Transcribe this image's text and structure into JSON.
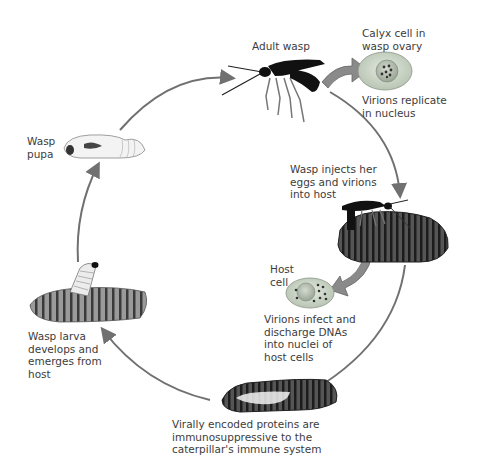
{
  "diagram": {
    "type": "life-cycle",
    "stages": [
      {
        "id": "adult-wasp",
        "label": "Adult wasp"
      },
      {
        "id": "calyx-cell",
        "label": "Calyx cell in\nwasp ovary",
        "caption": "Virions replicate\nin nucleus"
      },
      {
        "id": "injection",
        "label": "Wasp injects her\neggs and virions\ninto host"
      },
      {
        "id": "host-cell",
        "label": "Host\ncell",
        "caption": "Virions infect and\ndischarge DNAs\ninto nuclei of\nhost cells"
      },
      {
        "id": "immunosuppression",
        "label": "Virally encoded proteins are\nimmunosuppressive to the\ncaterpillar's immune system"
      },
      {
        "id": "larva",
        "label": "Wasp larva\ndevelops and\nemerges from\nhost"
      },
      {
        "id": "pupa",
        "label": "Wasp\npupa"
      }
    ],
    "colors": {
      "arrow": "#707070",
      "cell_fill": "#c9d3c4",
      "nucleus_fill": "#a9b4a4",
      "wasp": "#111111",
      "caterpillar": "#3a3a3a",
      "text": "#3c3c3c"
    }
  }
}
